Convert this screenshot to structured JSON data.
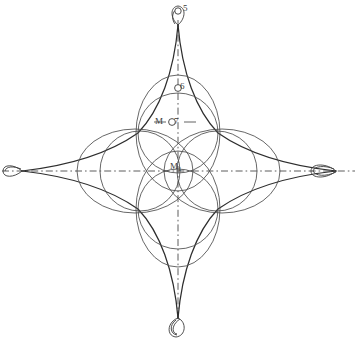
{
  "figure": {
    "kind": "geometric-construction-diagram",
    "width": 357,
    "height": 338,
    "background_color": "#ffffff",
    "ink_color": "#2e2e2e",
    "light_ink_color": "#555555",
    "centerline_color": "#4a4a4a",
    "center": {
      "x": 178,
      "y": 170
    }
  },
  "labels": {
    "top_cusp": "5",
    "upper_circle": "6",
    "mid_m": "M",
    "mid_number": "7",
    "center_m": "M",
    "center_subscript": "1"
  },
  "markers": [
    {
      "name": "marker-5",
      "label": "5",
      "x": 178,
      "y": 10,
      "r": 3.2
    },
    {
      "name": "marker-6",
      "label": "6",
      "x": 178,
      "y": 89,
      "r": 3.4
    },
    {
      "name": "marker-7",
      "label": "7",
      "x": 172,
      "y": 122,
      "r": 3.4
    }
  ],
  "geometry": {
    "astroid": {
      "cusp_top": {
        "x": 178,
        "y": 25
      },
      "cusp_bottom": {
        "x": 178,
        "y": 318
      },
      "cusp_left": {
        "x": 22,
        "y": 171
      },
      "cusp_right": {
        "x": 336,
        "y": 171
      },
      "radius_x": 157,
      "radius_y": 147
    },
    "centerlines": {
      "horizontal": {
        "y": 171,
        "x1": 2,
        "x2": 355
      },
      "vertical": {
        "x": 178,
        "y1": 22,
        "y2": 320
      },
      "dash_pattern": "7 3 1.6 3"
    },
    "ellipses": [
      {
        "name": "ellipse-north",
        "cx": 178,
        "cy": 133,
        "rx": 42,
        "ry": 58,
        "rotation": 0
      },
      {
        "name": "ellipse-south",
        "cx": 178,
        "cy": 209,
        "rx": 42,
        "ry": 58,
        "rotation": 0
      },
      {
        "name": "ellipse-west",
        "cx": 135,
        "cy": 171,
        "rx": 58,
        "ry": 42,
        "rotation": 0
      },
      {
        "name": "ellipse-east",
        "cx": 222,
        "cy": 171,
        "rx": 58,
        "ry": 42,
        "rotation": 0
      }
    ],
    "circles": [
      {
        "name": "circle-upper",
        "cx": 178,
        "cy": 133,
        "r": 40
      },
      {
        "name": "circle-lower",
        "cx": 178,
        "cy": 209,
        "r": 40
      },
      {
        "name": "circle-left",
        "cx": 140,
        "cy": 171,
        "r": 40
      },
      {
        "name": "circle-right",
        "cx": 217,
        "cy": 171,
        "r": 40
      }
    ],
    "cusp_loops": [
      {
        "name": "loop-top",
        "cx": 178,
        "cy": 14,
        "rx": 5,
        "ry": 9
      },
      {
        "name": "loop-bottom",
        "cx": 177,
        "cy": 326,
        "rx": 6,
        "ry": 10
      },
      {
        "name": "loop-left",
        "cx": 16,
        "cy": 171,
        "rx": 12,
        "ry": 6
      },
      {
        "name": "loop-right",
        "cx": 326,
        "cy": 171,
        "rx": 14,
        "ry": 6
      }
    ]
  }
}
